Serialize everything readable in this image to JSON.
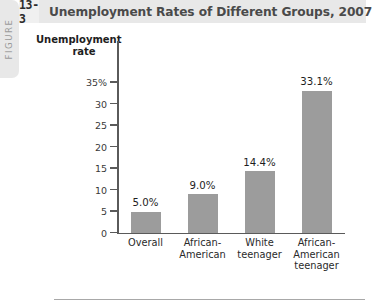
{
  "figure": {
    "tab_label": "FIGURE",
    "number": "13-3",
    "title": "Unemployment Rates of Different Groups, 2007"
  },
  "colors": {
    "bar": "#9c9c9c",
    "header_background": "#e8e8e8",
    "number_box_background": "#f0f0f0",
    "axis": "#5a5a5a",
    "title_text": "#4a4a4a"
  },
  "chart_data": {
    "type": "bar",
    "title": "Unemployment Rates of Different Groups, 2007",
    "xlabel": "",
    "ylabel": "Unemployment rate",
    "ylabel_line1": "Unemployment",
    "ylabel_line2": "rate",
    "categories": [
      "Overall",
      "African-American",
      "White teenager",
      "African-American teenager"
    ],
    "category_lines": [
      [
        "Overall"
      ],
      [
        "African-",
        "American"
      ],
      [
        "White",
        "teenager"
      ],
      [
        "African-",
        "American",
        "teenager"
      ]
    ],
    "values": [
      5.0,
      9.0,
      14.4,
      33.1
    ],
    "value_labels": [
      "5.0%",
      "9.0%",
      "14.4%",
      "33.1%"
    ],
    "ylim": [
      0,
      35
    ],
    "yticks": [
      0,
      5,
      10,
      15,
      20,
      25,
      30,
      35
    ],
    "ytick_labels": [
      "0",
      "5",
      "10",
      "15",
      "20",
      "25",
      "30",
      "35%"
    ],
    "grid": false,
    "legend": false
  }
}
